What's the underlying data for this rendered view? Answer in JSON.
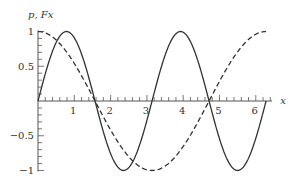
{
  "chart_data": {
    "type": "line",
    "title": "",
    "xlabel": "x",
    "ylabel": "p, Fx",
    "xlim": [
      0,
      6.283
    ],
    "ylim": [
      -1,
      1
    ],
    "grid": false,
    "legend": null,
    "x_ticks": [
      1,
      2,
      3,
      4,
      5,
      6
    ],
    "x_tick_labels": [
      "1",
      "2",
      "3",
      "4",
      "5",
      "6"
    ],
    "y_ticks": [
      1,
      0.5,
      -0.5,
      -1
    ],
    "y_tick_labels": [
      "1",
      "0.5",
      "−0.5",
      "−1"
    ],
    "series": [
      {
        "name": "solid",
        "style": "solid",
        "function": "sin(2x)",
        "x": [
          0,
          0.785,
          1.571,
          2.356,
          3.142,
          3.927,
          4.712,
          5.498,
          6.283
        ],
        "values": [
          0,
          1,
          0,
          -1,
          0,
          1,
          0,
          -1,
          0
        ]
      },
      {
        "name": "dashed",
        "style": "dashed",
        "function": "cos(x)",
        "x": [
          0,
          0.785,
          1.571,
          2.356,
          3.142,
          3.927,
          4.712,
          5.498,
          6.283
        ],
        "values": [
          1,
          0.707,
          0,
          -0.707,
          -1,
          -0.707,
          0,
          0.707,
          1
        ]
      }
    ],
    "colors": {
      "line": "#333333",
      "axis": "#555555"
    }
  }
}
